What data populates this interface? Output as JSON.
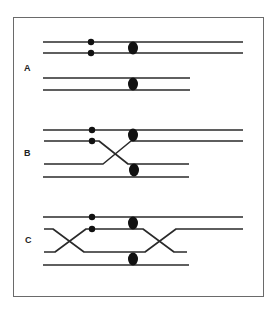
{
  "figure": {
    "panels": [
      {
        "label": "A",
        "description": "Two homologous chromosome pairs, unpaired, each with a centromere; upper pair carries two small markers"
      },
      {
        "label": "B",
        "description": "Single crossover between second and third strands between the markers and centromere"
      },
      {
        "label": "C",
        "description": "Double crossover between second and third strands on both sides of the centromere"
      }
    ],
    "colors": {
      "line": "#2a2a2a",
      "marker": "#111111",
      "frame": "#6a6a6a",
      "background": "#ffffff"
    }
  }
}
